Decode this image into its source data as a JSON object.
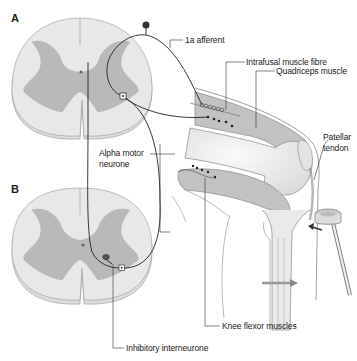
{
  "panels": {
    "a": "A",
    "b": "B"
  },
  "labels": {
    "afferent": "1a afferent",
    "intrafusal": "Intrafusal muscle fibre",
    "quadriceps": "Quadriceps muscle",
    "patellar_line1": "Patellar",
    "patellar_line2": "tendon",
    "alpha_line1": "Alpha motor",
    "alpha_line2": "neurone",
    "knee_flexor": "Knee flexor muscles",
    "inhibitory": "Inhibitory interneurone"
  },
  "colors": {
    "white_matter": "#e6e6e6",
    "grey_matter": "#b8b8b8",
    "muscle": "#bdbdbd",
    "bone": "#efefef",
    "line": "#333333",
    "arrow": "#888888"
  }
}
